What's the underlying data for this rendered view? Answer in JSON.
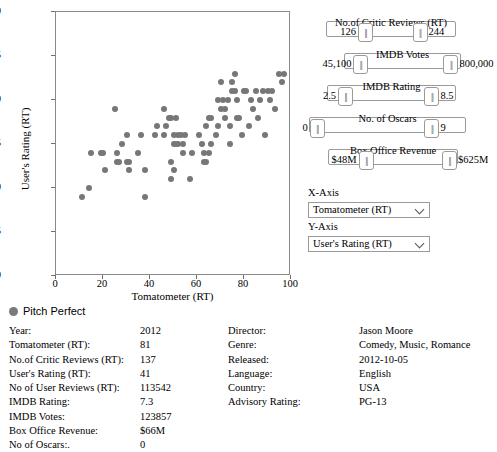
{
  "chart_data": {
    "type": "scatter",
    "title": "",
    "xlabel": "Tomatometer (RT)",
    "ylabel": "User's Rating (RT)",
    "xlim": [
      0,
      100
    ],
    "ylim": [
      2.0,
      5.0
    ],
    "xticks": [
      0,
      20,
      40,
      60,
      80,
      100
    ],
    "yticks": [
      "2.0",
      "2.5",
      "3.0",
      "3.5",
      "4.0",
      "4.5",
      "5.0"
    ],
    "grid": false,
    "legend": "Pitch Perfect",
    "marker_color": "#777779",
    "points": [
      [
        11,
        2.9
      ],
      [
        14,
        3.0
      ],
      [
        15,
        3.4
      ],
      [
        19,
        3.4
      ],
      [
        20,
        3.4
      ],
      [
        21,
        3.2
      ],
      [
        25,
        3.9
      ],
      [
        26,
        3.3
      ],
      [
        26,
        3.4
      ],
      [
        27,
        3.3
      ],
      [
        28,
        3.5
      ],
      [
        30,
        3.3
      ],
      [
        30,
        3.6
      ],
      [
        31,
        3.3
      ],
      [
        31,
        3.2
      ],
      [
        35,
        3.4
      ],
      [
        36,
        3.6
      ],
      [
        38,
        2.9
      ],
      [
        38,
        3.2
      ],
      [
        42,
        3.6
      ],
      [
        43,
        3.7
      ],
      [
        46,
        3.9
      ],
      [
        46,
        3.6
      ],
      [
        47,
        3.7
      ],
      [
        48,
        3.8
      ],
      [
        49,
        3.8
      ],
      [
        49,
        3.3
      ],
      [
        49,
        3.1
      ],
      [
        50,
        3.6
      ],
      [
        50,
        3.2
      ],
      [
        50,
        3.5
      ],
      [
        51,
        3.5
      ],
      [
        51,
        3.8
      ],
      [
        52,
        3.5
      ],
      [
        52,
        3.6
      ],
      [
        53,
        3.6
      ],
      [
        54,
        3.5
      ],
      [
        54,
        3.4
      ],
      [
        55,
        3.6
      ],
      [
        57,
        3.1
      ],
      [
        58,
        3.4
      ],
      [
        61,
        3.6
      ],
      [
        62,
        3.5
      ],
      [
        63,
        3.3
      ],
      [
        63,
        3.4
      ],
      [
        64,
        3.3
      ],
      [
        64,
        3.7
      ],
      [
        65,
        3.8
      ],
      [
        65,
        3.4
      ],
      [
        66,
        3.8
      ],
      [
        66,
        3.5
      ],
      [
        68,
        3.6
      ],
      [
        69,
        4.0
      ],
      [
        69,
        3.7
      ],
      [
        70,
        4.2
      ],
      [
        70,
        3.9
      ],
      [
        71,
        4.0
      ],
      [
        72,
        3.8
      ],
      [
        72,
        3.9
      ],
      [
        73,
        4.0
      ],
      [
        74,
        3.7
      ],
      [
        74,
        3.5
      ],
      [
        75,
        4.2
      ],
      [
        75,
        4.1
      ],
      [
        76,
        4.3
      ],
      [
        76,
        4.1
      ],
      [
        77,
        3.8
      ],
      [
        77,
        4.0
      ],
      [
        78,
        3.8
      ],
      [
        79,
        3.6
      ],
      [
        80,
        4.1
      ],
      [
        81,
        4.1
      ],
      [
        82,
        3.7
      ],
      [
        83,
        4.0
      ],
      [
        84,
        3.9
      ],
      [
        85,
        4.1
      ],
      [
        86,
        3.8
      ],
      [
        87,
        4.0
      ],
      [
        88,
        4.1
      ],
      [
        89,
        3.6
      ],
      [
        90,
        4.1
      ],
      [
        91,
        4.0
      ],
      [
        92,
        4.1
      ],
      [
        93,
        3.9
      ],
      [
        95,
        4.3
      ],
      [
        96,
        4.2
      ],
      [
        97,
        4.3
      ]
    ]
  },
  "controls": {
    "sliders": [
      {
        "name": "No.of Critic Reviews (RT)",
        "min_label": "126",
        "max_label": "244",
        "left": 26,
        "width": 130,
        "top": 14,
        "handle_lo_pct": 30,
        "handle_hi_pct": 72
      },
      {
        "name": "IMDB Votes",
        "min_label": "45,100",
        "max_label": "800,000",
        "left": 44,
        "width": 117,
        "top": 46,
        "handle_lo_pct": 14,
        "handle_hi_pct": 91
      },
      {
        "name": "IMDB Rating",
        "min_label": "2.5",
        "max_label": "8.5",
        "left": 27,
        "width": 129,
        "top": 78,
        "handle_lo_pct": 14,
        "handle_hi_pct": 81
      },
      {
        "name": "No. of Oscars",
        "min_label": "0",
        "max_label": "9",
        "left": 9,
        "width": 157,
        "top": 110,
        "handle_lo_pct": 5,
        "handle_hi_pct": 78
      },
      {
        "name": "Box Office Revenue",
        "min_label": "$48M",
        "max_label": "$625M",
        "left": 28,
        "width": 130,
        "top": 142,
        "handle_lo_pct": 29,
        "handle_hi_pct": 93
      }
    ],
    "x_axis": {
      "label": "X-Axis",
      "value": "Tomatometer (RT)"
    },
    "y_axis": {
      "label": "Y-Axis",
      "value": "User's Rating (RT)"
    }
  },
  "detail": {
    "title": "Pitch Perfect",
    "left_fields": [
      {
        "key": "Year:",
        "value": "2012"
      },
      {
        "key": "Tomatometer (RT):",
        "value": "81"
      },
      {
        "key": "No.of Critic Reviews (RT):",
        "value": "137"
      },
      {
        "key": "User's Rating (RT):",
        "value": "41"
      },
      {
        "key": "No of User Reviews (RT):",
        "value": "113542"
      },
      {
        "key": "IMDB Rating:",
        "value": "7.3"
      },
      {
        "key": "IMDB Votes:",
        "value": "123857"
      },
      {
        "key": "Box Office Revenue:",
        "value": "$66M"
      },
      {
        "key": "No of Oscars:.",
        "value": "0"
      }
    ],
    "right_fields": [
      {
        "key": "Director:",
        "value": "Jason Moore"
      },
      {
        "key": "Genre:",
        "value": "Comedy, Music, Romance"
      },
      {
        "key": "Released:",
        "value": "2012-10-05"
      },
      {
        "key": "Language:",
        "value": "English"
      },
      {
        "key": "Country:",
        "value": "USA"
      },
      {
        "key": "Advisory Rating:",
        "value": "PG-13"
      }
    ]
  }
}
